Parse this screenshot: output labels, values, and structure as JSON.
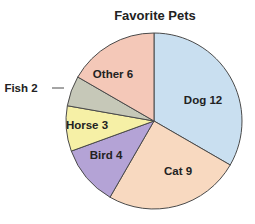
{
  "chart_data": {
    "type": "pie",
    "title": "Favorite Pets",
    "categories": [
      "Dog",
      "Cat",
      "Bird",
      "Horse",
      "Fish",
      "Other"
    ],
    "values": [
      12,
      9,
      4,
      3,
      2,
      6
    ],
    "colors": [
      "#c9dff0",
      "#f8d9c0",
      "#b4a3d6",
      "#f6f0a6",
      "#c6c8b8",
      "#f4c8b8"
    ],
    "labels": [
      "Dog  12",
      "Cat  9",
      "Bird  4",
      "Horse  3",
      "Fish  2",
      "Other  6"
    ],
    "start_angle": "top, clockwise"
  }
}
